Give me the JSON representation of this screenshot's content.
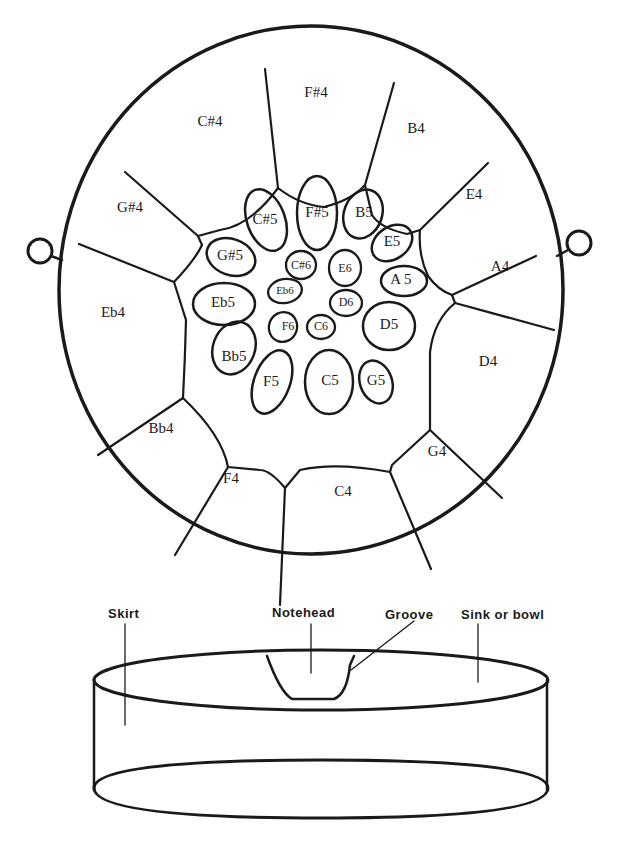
{
  "diagram": {
    "outer_notes": [
      {
        "id": "fs4",
        "label": "F#4"
      },
      {
        "id": "b4",
        "label": "B4"
      },
      {
        "id": "e4",
        "label": "E4"
      },
      {
        "id": "a4",
        "label": "A4"
      },
      {
        "id": "d4",
        "label": "D4"
      },
      {
        "id": "g4",
        "label": "G4"
      },
      {
        "id": "c4",
        "label": "C4"
      },
      {
        "id": "f4",
        "label": "F4"
      },
      {
        "id": "bb4",
        "label": "Bb4"
      },
      {
        "id": "eb4",
        "label": "Eb4"
      },
      {
        "id": "gs4",
        "label": "G#4"
      },
      {
        "id": "cs4",
        "label": "C#4"
      }
    ],
    "middle_notes": [
      {
        "id": "fs5",
        "label": "F#5"
      },
      {
        "id": "b5",
        "label": "B5"
      },
      {
        "id": "e5",
        "label": "E5"
      },
      {
        "id": "a5",
        "label": "A 5"
      },
      {
        "id": "d5",
        "label": "D5"
      },
      {
        "id": "g5",
        "label": "G5"
      },
      {
        "id": "c5",
        "label": "C5"
      },
      {
        "id": "f5",
        "label": "F5"
      },
      {
        "id": "bb5",
        "label": "Bb5"
      },
      {
        "id": "eb5",
        "label": "Eb5"
      },
      {
        "id": "gs5",
        "label": "G#5"
      },
      {
        "id": "cs5",
        "label": "C#5"
      }
    ],
    "inner_notes": [
      {
        "id": "cs6",
        "label": "C#6"
      },
      {
        "id": "e6",
        "label": "E6"
      },
      {
        "id": "eb6",
        "label": "Eb6"
      },
      {
        "id": "d6",
        "label": "D6"
      },
      {
        "id": "f6",
        "label": "F6"
      },
      {
        "id": "c6",
        "label": "C6"
      }
    ],
    "cross_section": {
      "labels": {
        "skirt": "Skirt",
        "notehead": "Notehead",
        "groove": "Groove",
        "sink": "Sink or bowl"
      }
    }
  }
}
